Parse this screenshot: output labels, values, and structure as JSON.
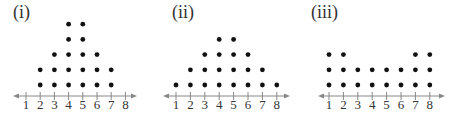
{
  "chart_data": [
    {
      "type": "dot",
      "title": "(i)",
      "categories": [
        "1",
        "2",
        "3",
        "4",
        "5",
        "6",
        "7",
        "8"
      ],
      "x": [
        1,
        2,
        3,
        4,
        5,
        6,
        7,
        8
      ],
      "values": [
        0,
        2,
        3,
        5,
        5,
        3,
        2,
        0
      ],
      "xlabel": "",
      "ylabel": "",
      "xlim": [
        1,
        8
      ],
      "grid": false,
      "legend": null
    },
    {
      "type": "dot",
      "title": "(ii)",
      "categories": [
        "1",
        "2",
        "3",
        "4",
        "5",
        "6",
        "7",
        "8"
      ],
      "x": [
        1,
        2,
        3,
        4,
        5,
        6,
        7,
        8
      ],
      "values": [
        1,
        2,
        3,
        4,
        4,
        3,
        2,
        1
      ],
      "xlabel": "",
      "ylabel": "",
      "xlim": [
        1,
        8
      ],
      "grid": false,
      "legend": null
    },
    {
      "type": "dot",
      "title": "(iii)",
      "categories": [
        "1",
        "2",
        "3",
        "4",
        "5",
        "6",
        "7",
        "8"
      ],
      "x": [
        1,
        2,
        3,
        4,
        5,
        6,
        7,
        8
      ],
      "values": [
        3,
        3,
        2,
        2,
        2,
        2,
        3,
        3
      ],
      "xlabel": "",
      "ylabel": "",
      "xlim": [
        1,
        8
      ],
      "grid": false,
      "legend": null
    }
  ],
  "plots": [
    {
      "label": "(i)",
      "tick1_x": 26,
      "tick_spacing": 14.2,
      "axis_start": 13,
      "axis_end": 137,
      "label_x": 13
    },
    {
      "label": "(ii)",
      "tick1_x": 176,
      "tick_spacing": 14.4,
      "axis_start": 163,
      "axis_end": 290,
      "label_x": 172
    },
    {
      "label": "(iii)",
      "tick1_x": 329,
      "tick_spacing": 14.4,
      "axis_start": 318,
      "axis_end": 445,
      "label_x": 311
    }
  ],
  "style": {
    "dot_color": "#111111",
    "axis_color": "#888888",
    "label_color": "#333333",
    "axis_y": 96,
    "tick_label_y": 109,
    "dot_base_y": 85,
    "dot_row_spacing": 15.2,
    "dot_radius": 2.4
  }
}
